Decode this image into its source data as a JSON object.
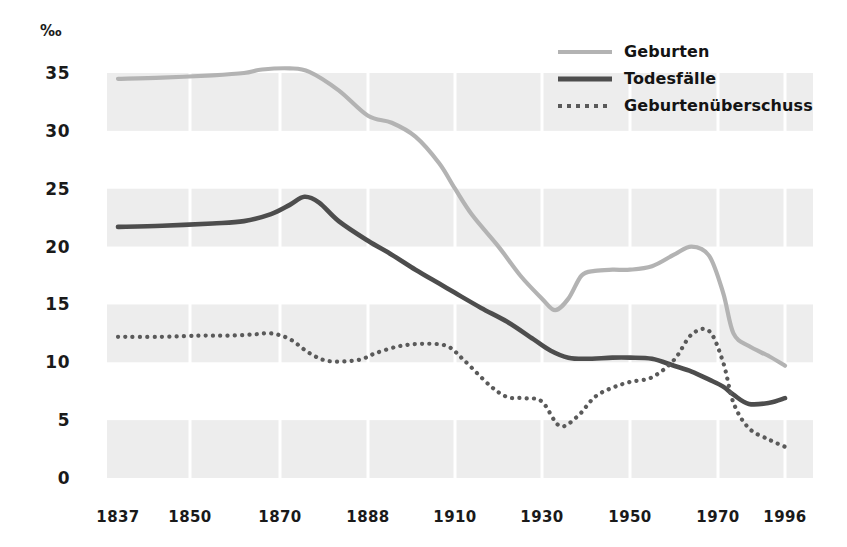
{
  "chart_data": {
    "type": "line",
    "title": "",
    "subtitle": "",
    "xlabel": "",
    "ylabel": "‰",
    "unit_symbol": "‰",
    "grid": true,
    "grid_style": "horizontal-banded",
    "legend_position": "top-right",
    "xlim": [
      1837,
      1996
    ],
    "ylim": [
      0,
      36
    ],
    "y_ticks": [
      "0",
      "5",
      "10",
      "15",
      "20",
      "25",
      "30",
      "35"
    ],
    "y_tick_values": [
      0,
      5,
      10,
      15,
      20,
      25,
      30,
      35
    ],
    "x_ticks": [
      "1837",
      "1850",
      "1870",
      "1888",
      "1910",
      "1930",
      "1950",
      "1970",
      "1996"
    ],
    "x_tick_values": [
      1837,
      1850,
      1870,
      1888,
      1910,
      1930,
      1950,
      1970,
      1996
    ],
    "band_ranges": [
      [
        0,
        5
      ],
      [
        10,
        15
      ],
      [
        20,
        25
      ],
      [
        30,
        35
      ]
    ],
    "colors": {
      "births": "#b3b3b3",
      "deaths": "#4d4d4d",
      "surplus": "#5a5a5a",
      "band": "#ededed",
      "text": "#1a1a1a",
      "background": "#ffffff"
    },
    "series": [
      {
        "name": "Geburten",
        "style": "solid",
        "color": "#b3b3b3",
        "x": [
          1837,
          1845,
          1855,
          1862,
          1866,
          1872,
          1876,
          1882,
          1888,
          1894,
          1900,
          1906,
          1910,
          1914,
          1920,
          1925,
          1930,
          1933,
          1936,
          1939,
          1942,
          1946,
          1950,
          1955,
          1960,
          1964,
          1968,
          1972,
          1976,
          1982,
          1990,
          1996
        ],
        "values": [
          34.5,
          34.6,
          34.8,
          35.0,
          35.3,
          35.4,
          35.1,
          33.5,
          31.3,
          30.7,
          29.5,
          27.2,
          25.0,
          22.7,
          20.0,
          17.5,
          15.5,
          14.5,
          15.5,
          17.5,
          17.9,
          18.0,
          18.0,
          18.3,
          19.3,
          20.0,
          19.2,
          16.0,
          12.5,
          11.4,
          10.5,
          9.7
        ]
      },
      {
        "name": "Todesfälle",
        "style": "solid",
        "color": "#4d4d4d",
        "x": [
          1837,
          1845,
          1855,
          1862,
          1868,
          1872,
          1875,
          1878,
          1882,
          1888,
          1894,
          1900,
          1906,
          1910,
          1916,
          1922,
          1928,
          1932,
          1936,
          1940,
          1946,
          1950,
          1955,
          1960,
          1964,
          1968,
          1972,
          1976,
          1982,
          1990,
          1996
        ],
        "values": [
          21.7,
          21.8,
          22.0,
          22.2,
          22.8,
          23.6,
          24.3,
          23.8,
          22.2,
          20.5,
          19.3,
          18.0,
          16.8,
          16.0,
          14.7,
          13.5,
          12.0,
          11.0,
          10.4,
          10.3,
          10.4,
          10.4,
          10.3,
          9.7,
          9.2,
          8.5,
          7.9,
          7.2,
          6.4,
          6.5,
          6.9
        ]
      },
      {
        "name": "Geburtenüberschuss",
        "style": "dotted",
        "color": "#5a5a5a",
        "x": [
          1837,
          1845,
          1852,
          1858,
          1864,
          1868,
          1872,
          1876,
          1880,
          1886,
          1890,
          1896,
          1902,
          1908,
          1912,
          1918,
          1922,
          1926,
          1930,
          1934,
          1938,
          1942,
          1946,
          1950,
          1955,
          1960,
          1964,
          1968,
          1972,
          1976,
          1982,
          1990,
          1996
        ],
        "values": [
          12.2,
          12.2,
          12.3,
          12.3,
          12.4,
          12.5,
          12.0,
          10.8,
          10.1,
          10.2,
          10.8,
          11.4,
          11.6,
          11.4,
          10.2,
          8.0,
          7.0,
          6.9,
          6.6,
          4.5,
          5.3,
          7.0,
          7.8,
          8.3,
          8.7,
          10.2,
          12.4,
          12.7,
          10.0,
          6.5,
          4.3,
          3.3,
          2.7
        ]
      }
    ]
  },
  "legend": {
    "items": [
      {
        "label": "Geburten",
        "style": "solid",
        "color": "#b3b3b3",
        "thickness": 4
      },
      {
        "label": "Todesfälle",
        "style": "solid",
        "color": "#4d4d4d",
        "thickness": 5
      },
      {
        "label": "Geburtenüberschuss",
        "style": "dotted",
        "color": "#5a5a5a",
        "thickness": 4
      }
    ]
  }
}
